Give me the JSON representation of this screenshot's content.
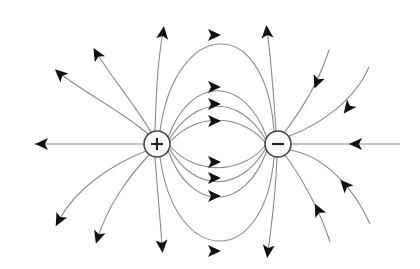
{
  "diagram": {
    "colors": {
      "background": "#ffffff",
      "line": "#8a8a8a",
      "arrow": "#111111",
      "charge_stroke": "#444444"
    },
    "charges": [
      {
        "id": "positive",
        "sign": "+",
        "cx": 157,
        "cy": 144,
        "r": 13
      },
      {
        "id": "negative",
        "sign": "−",
        "cx": 278,
        "cy": 144,
        "r": 13
      }
    ],
    "field_lines": [
      {
        "name": "axis-left",
        "d": "M144 144 L34 144",
        "arrow": {
          "x": 42,
          "y": 144,
          "angle": 180
        }
      },
      {
        "name": "axis-right",
        "d": "M291 144 L400 144",
        "arrow": {
          "x": 356,
          "y": 144,
          "angle": 180
        }
      },
      {
        "name": "pos-up-left-1",
        "d": "M148 134 C120 110 80 90 58 72",
        "arrow": {
          "x": 60,
          "y": 74,
          "angle": 222
        }
      },
      {
        "name": "pos-up-left-2",
        "d": "M151 132 C135 105 110 75 96 52",
        "arrow": {
          "x": 97,
          "y": 54,
          "angle": 240
        }
      },
      {
        "name": "pos-up",
        "d": "M155 131 C156 100 157 65 163 32",
        "arrow": {
          "x": 163,
          "y": 33,
          "angle": 278
        }
      },
      {
        "name": "pos-down-left-1",
        "d": "M146 151 C110 165 75 190 59 220",
        "arrow": {
          "x": 59,
          "y": 220,
          "angle": 118
        }
      },
      {
        "name": "pos-down-left-2",
        "d": "M149 155 C130 175 108 205 98 237",
        "arrow": {
          "x": 98,
          "y": 237,
          "angle": 108
        }
      },
      {
        "name": "pos-down",
        "d": "M155 157 C157 185 160 215 162 246",
        "arrow": {
          "x": 162,
          "y": 246,
          "angle": 85
        }
      },
      {
        "name": "neg-up",
        "d": "M276 131 C274 100 271 60 267 30",
        "arrow": {
          "x": 267,
          "y": 32,
          "angle": 265
        }
      },
      {
        "name": "neg-down",
        "d": "M277 157 C276 185 273 215 268 251",
        "arrow": {
          "x": 268,
          "y": 251,
          "angle": 97
        }
      },
      {
        "name": "inner-top-loop",
        "d": "M160 131 C175 20 265 10 274 131",
        "arrow": {
          "x": 214,
          "y": 35,
          "angle": 0
        }
      },
      {
        "name": "inner-bottom-loop",
        "d": "M160 157 C175 268 265 270 274 157",
        "arrow": {
          "x": 214,
          "y": 251,
          "angle": 0
        }
      },
      {
        "name": "mid-top-1",
        "d": "M168 138 C190 75 245 75 267 138",
        "arrow": {
          "x": 214,
          "y": 87,
          "angle": 0
        }
      },
      {
        "name": "mid-top-2",
        "d": "M169 140 C195 95 240 95 266 140",
        "arrow": {
          "x": 214,
          "y": 104,
          "angle": 0
        }
      },
      {
        "name": "mid-top-3",
        "d": "M170 142 C195 113 240 113 265 142",
        "arrow": {
          "x": 214,
          "y": 121,
          "angle": 0
        }
      },
      {
        "name": "mid-bottom-1",
        "d": "M170 146 C195 175 240 175 265 146",
        "arrow": {
          "x": 214,
          "y": 162,
          "angle": 0
        }
      },
      {
        "name": "mid-bottom-2",
        "d": "M169 148 C195 193 240 193 266 148",
        "arrow": {
          "x": 214,
          "y": 178,
          "angle": 0
        }
      },
      {
        "name": "mid-bottom-3",
        "d": "M168 150 C190 213 245 213 267 150",
        "arrow": {
          "x": 214,
          "y": 196,
          "angle": 0
        }
      },
      {
        "name": "incoming-upper-right-1",
        "d": "M329 50 C318 85 300 112 284 133",
        "arrow": {
          "x": 317,
          "y": 82,
          "angle": 112
        }
      },
      {
        "name": "incoming-upper-right-2",
        "d": "M369 67 C355 100 320 125 287 137",
        "arrow": {
          "x": 348,
          "y": 108,
          "angle": 128
        }
      },
      {
        "name": "incoming-lower-right-1",
        "d": "M370 224 C355 190 325 155 289 150",
        "arrow": {
          "x": 345,
          "y": 185,
          "angle": 228
        }
      },
      {
        "name": "incoming-lower-right-2",
        "d": "M330 242 C320 210 300 175 285 155",
        "arrow": {
          "x": 318,
          "y": 210,
          "angle": 243
        }
      }
    ]
  }
}
